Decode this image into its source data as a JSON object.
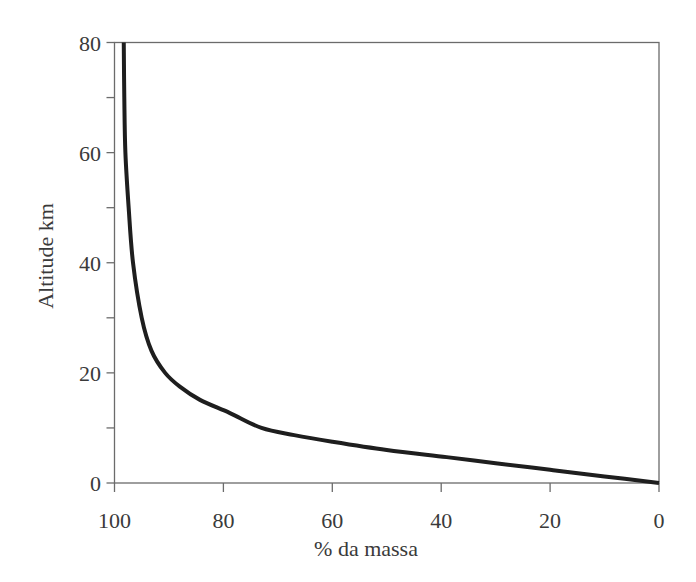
{
  "chart_data": {
    "type": "line",
    "title": "",
    "xlabel": "% da massa",
    "ylabel": "Altitude km",
    "xlim": [
      100,
      0
    ],
    "ylim": [
      0,
      80
    ],
    "x_reversed": true,
    "grid": false,
    "legend": null,
    "x_ticks": [
      100,
      80,
      60,
      40,
      20,
      0
    ],
    "x_tick_labels": [
      "100",
      "80",
      "60",
      "40",
      "20",
      "0"
    ],
    "x_minor_ticks": [],
    "y_ticks": [
      0,
      20,
      40,
      60,
      80
    ],
    "y_tick_labels": [
      "0",
      "20",
      "40",
      "60",
      "80"
    ],
    "y_minor_ticks": [
      10,
      30,
      50,
      70
    ],
    "series": [
      {
        "name": "Cumulative atmospheric mass below altitude",
        "points": [
          {
            "x": 0.0,
            "y": 0.0
          },
          {
            "x": 10.0,
            "y": 1.2
          },
          {
            "x": 20.0,
            "y": 2.4
          },
          {
            "x": 30.0,
            "y": 3.6
          },
          {
            "x": 39.0,
            "y": 4.7
          },
          {
            "x": 50.0,
            "y": 6.0
          },
          {
            "x": 60.0,
            "y": 7.5
          },
          {
            "x": 67.0,
            "y": 8.7
          },
          {
            "x": 73.0,
            "y": 10.0
          },
          {
            "x": 78.8,
            "y": 12.7
          },
          {
            "x": 84.3,
            "y": 15.1
          },
          {
            "x": 88.0,
            "y": 17.5
          },
          {
            "x": 90.7,
            "y": 20.0
          },
          {
            "x": 93.2,
            "y": 24.0
          },
          {
            "x": 95.0,
            "y": 30.0
          },
          {
            "x": 96.6,
            "y": 40.0
          },
          {
            "x": 97.4,
            "y": 50.0
          },
          {
            "x": 98.0,
            "y": 60.0
          },
          {
            "x": 98.2,
            "y": 70.0
          },
          {
            "x": 98.3,
            "y": 80.0
          }
        ]
      }
    ]
  }
}
